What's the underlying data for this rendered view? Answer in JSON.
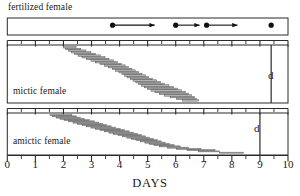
{
  "chart_data": {
    "type": "bar",
    "title": "",
    "xlabel": "DAYS",
    "ylabel": "",
    "xlim": [
      0,
      10
    ],
    "xticks": [
      0,
      1,
      2,
      3,
      4,
      5,
      6,
      7,
      8,
      9,
      10
    ],
    "xtick_labels": [
      "0",
      "1",
      "2",
      "3",
      "4",
      "5",
      "6",
      "7",
      "8",
      "9",
      "10"
    ],
    "minor_tick_step": 0.5,
    "grid": false,
    "legend": null,
    "panels": [
      {
        "name": "fertilized-female",
        "label": "fertilized female",
        "label_position": "above",
        "type": "event-arrows",
        "divider_day": null,
        "divider_label": null,
        "events": [
          {
            "dot_day": 3.75,
            "arrow_end_day": 5.25
          },
          {
            "dot_day": 6.0,
            "arrow_end_day": 6.85
          },
          {
            "dot_day": 7.1,
            "arrow_end_day": 8.2
          },
          {
            "dot_day": 9.4,
            "arrow_end_day": null
          }
        ]
      },
      {
        "name": "mictic-female",
        "label": "mictic female",
        "label_position": "inside-bottom-left",
        "type": "stacked-horizontal-bars",
        "divider_day": 9.4,
        "divider_label": "d",
        "bars": [
          {
            "start": 2.0,
            "end": 2.45
          },
          {
            "start": 2.08,
            "end": 2.62
          },
          {
            "start": 2.18,
            "end": 2.8
          },
          {
            "start": 2.28,
            "end": 2.98
          },
          {
            "start": 2.4,
            "end": 3.15
          },
          {
            "start": 2.52,
            "end": 3.32
          },
          {
            "start": 2.66,
            "end": 3.48
          },
          {
            "start": 2.82,
            "end": 3.62
          },
          {
            "start": 2.98,
            "end": 3.78
          },
          {
            "start": 3.14,
            "end": 3.92
          },
          {
            "start": 3.3,
            "end": 4.06
          },
          {
            "start": 3.46,
            "end": 4.2
          },
          {
            "start": 3.6,
            "end": 4.32
          },
          {
            "start": 3.74,
            "end": 4.44
          },
          {
            "start": 3.86,
            "end": 4.56
          },
          {
            "start": 3.98,
            "end": 4.68
          },
          {
            "start": 4.08,
            "end": 4.8
          },
          {
            "start": 4.18,
            "end": 4.92
          },
          {
            "start": 4.28,
            "end": 5.04
          },
          {
            "start": 4.38,
            "end": 5.18
          },
          {
            "start": 4.48,
            "end": 5.32
          },
          {
            "start": 4.58,
            "end": 5.46
          },
          {
            "start": 4.68,
            "end": 5.6
          },
          {
            "start": 4.78,
            "end": 5.76
          },
          {
            "start": 4.88,
            "end": 5.92
          },
          {
            "start": 5.0,
            "end": 6.06
          },
          {
            "start": 5.12,
            "end": 6.2
          },
          {
            "start": 5.26,
            "end": 6.34
          },
          {
            "start": 5.42,
            "end": 6.46
          },
          {
            "start": 5.6,
            "end": 6.56
          },
          {
            "start": 5.8,
            "end": 6.66
          },
          {
            "start": 6.02,
            "end": 6.74
          },
          {
            "start": 6.24,
            "end": 6.82
          }
        ]
      },
      {
        "name": "amictic-female",
        "label": "amictic female",
        "label_position": "inside-bottom-left",
        "type": "stacked-horizontal-bars",
        "divider_day": 9.0,
        "divider_label": "d",
        "bars": [
          {
            "start": 1.52,
            "end": 2.3
          },
          {
            "start": 1.62,
            "end": 2.46
          },
          {
            "start": 1.74,
            "end": 2.6
          },
          {
            "start": 1.88,
            "end": 2.74
          },
          {
            "start": 2.02,
            "end": 2.92
          },
          {
            "start": 2.18,
            "end": 3.1
          },
          {
            "start": 2.34,
            "end": 3.26
          },
          {
            "start": 2.5,
            "end": 3.4
          },
          {
            "start": 2.66,
            "end": 3.54
          },
          {
            "start": 2.82,
            "end": 3.7
          },
          {
            "start": 2.98,
            "end": 3.86
          },
          {
            "start": 3.14,
            "end": 4.02
          },
          {
            "start": 3.3,
            "end": 4.18
          },
          {
            "start": 3.46,
            "end": 4.34
          },
          {
            "start": 3.62,
            "end": 4.5
          },
          {
            "start": 3.78,
            "end": 4.64
          },
          {
            "start": 3.94,
            "end": 4.78
          },
          {
            "start": 4.1,
            "end": 4.92
          },
          {
            "start": 4.26,
            "end": 5.06
          },
          {
            "start": 4.42,
            "end": 5.2
          },
          {
            "start": 4.58,
            "end": 5.34
          },
          {
            "start": 4.74,
            "end": 5.48
          },
          {
            "start": 4.9,
            "end": 5.62
          },
          {
            "start": 5.06,
            "end": 5.78
          },
          {
            "start": 5.22,
            "end": 5.94
          },
          {
            "start": 5.42,
            "end": 6.16
          },
          {
            "start": 5.7,
            "end": 6.46
          },
          {
            "start": 6.02,
            "end": 6.9
          },
          {
            "start": 6.4,
            "end": 7.4
          },
          {
            "start": 6.8,
            "end": 7.56
          },
          {
            "start": 7.56,
            "end": 8.42
          }
        ]
      }
    ]
  },
  "colors": {
    "frame": "#2b2b2b",
    "bar_fill": "#b9b9b9",
    "bar_edge": "#4a4a4a",
    "text": "#1a1a1a",
    "dot": "#111111"
  },
  "labels": {
    "fertilized_female": "fertilized female",
    "mictic_female": "mictic female",
    "amictic_female": "amictic female",
    "d_mictic": "d",
    "d_amictic": "d",
    "days": "DAYS"
  }
}
